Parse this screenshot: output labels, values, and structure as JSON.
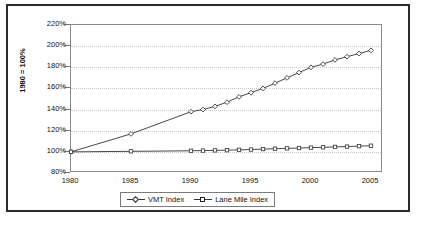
{
  "chart_data": {
    "type": "line",
    "title": "",
    "xlabel": "",
    "ylabel": "1980 = 100%",
    "x": [
      1980,
      1985,
      1990,
      1991,
      1992,
      1993,
      1994,
      1995,
      1996,
      1997,
      1998,
      1999,
      2000,
      2001,
      2002,
      2003,
      2004,
      2005
    ],
    "xlim": [
      1980,
      2006
    ],
    "ylim": [
      80,
      220
    ],
    "xticks": [
      "1980",
      "1985",
      "1990",
      "1995",
      "2000",
      "2005"
    ],
    "xtick_values": [
      1980,
      1985,
      1990,
      1995,
      2000,
      2005
    ],
    "yticks": [
      "80%",
      "100%",
      "120%",
      "140%",
      "160%",
      "180%",
      "200%",
      "220%"
    ],
    "ytick_values": [
      80,
      100,
      120,
      140,
      160,
      180,
      200,
      220
    ],
    "grid": true,
    "legend_position": "bottom",
    "series": [
      {
        "name": "VMT Index",
        "marker": "diamond",
        "values": [
          100,
          117,
          138,
          140,
          143,
          147,
          152,
          156,
          160,
          165,
          170,
          175,
          180,
          183,
          187,
          190,
          193,
          196
        ]
      },
      {
        "name": "Lane Mile Index",
        "marker": "square",
        "values": [
          100,
          100.5,
          101,
          101.2,
          101.4,
          101.6,
          101.9,
          102.2,
          102.6,
          103,
          103.3,
          103.6,
          104,
          104.3,
          104.7,
          105,
          105.4,
          105.8
        ]
      }
    ]
  },
  "legend": {
    "items": [
      {
        "label": "VMT Index"
      },
      {
        "label": "Lane Mile Index"
      }
    ]
  },
  "colors": {
    "frame": "#2b2b2b",
    "axis": "#8a8a8a",
    "grid": "#c9c9c9",
    "series_line": "#333333"
  }
}
